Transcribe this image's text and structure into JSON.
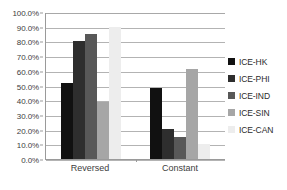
{
  "chart_data": {
    "type": "bar",
    "title": "",
    "xlabel": "",
    "ylabel": "",
    "categories": [
      "Reversed",
      "Constant"
    ],
    "series": [
      {
        "name": "ICE-HK",
        "color": "#111111",
        "values": [
          52.0,
          48.0
        ]
      },
      {
        "name": "ICE-PHI",
        "color": "#2e2e2e",
        "values": [
          80.0,
          20.5
        ]
      },
      {
        "name": "ICE-IND",
        "color": "#585858",
        "values": [
          85.0,
          15.0
        ]
      },
      {
        "name": "ICE-SIN",
        "color": "#a6a6a6",
        "values": [
          39.0,
          61.0
        ]
      },
      {
        "name": "ICE-CAN",
        "color": "#ededed",
        "values": [
          89.5,
          10.0
        ]
      }
    ],
    "ylim": [
      0,
      100
    ],
    "ytick_values": [
      0,
      10,
      20,
      30,
      40,
      50,
      60,
      70,
      80,
      90,
      100
    ],
    "ytick_labels": [
      "0.0%",
      "10.0%",
      "20.0%",
      "30.0%",
      "40.0%",
      "50.0%",
      "60.0%",
      "70.0%",
      "80.0%",
      "90.0%",
      "100.0%"
    ],
    "grid": "horizontal",
    "legend_position": "right",
    "axis_color": "#9a9a9a",
    "gridline_color": "#b3b3b3",
    "background": "#ffffff"
  }
}
